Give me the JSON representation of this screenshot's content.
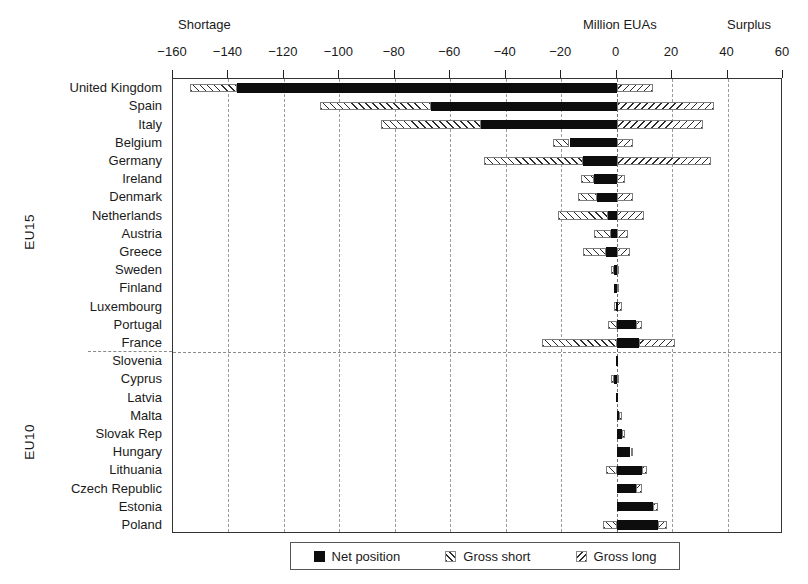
{
  "annotations": {
    "shortage": "Shortage",
    "unit": "Million EUAs",
    "surplus": "Surplus"
  },
  "groups": [
    {
      "id": "eu15",
      "label": "EU15"
    },
    {
      "id": "eu10",
      "label": "EU10"
    }
  ],
  "legend": {
    "items": [
      {
        "key": "net",
        "label": "Net position",
        "icon": "solid-square-swatch"
      },
      {
        "key": "short",
        "label": "Gross short",
        "icon": "backslash-hatch-swatch"
      },
      {
        "key": "long",
        "label": "Gross long",
        "icon": "forwardslash-hatch-swatch"
      }
    ]
  },
  "colors": {
    "net": "#0d0d0d",
    "hatch": "#2b2b2b",
    "grid": "#9a9a9a",
    "frame": "#333333",
    "background": "#ffffff"
  },
  "chart_data": {
    "type": "bar",
    "orientation": "horizontal",
    "title": "",
    "subtitle": "",
    "xlabel": "Million EUAs",
    "ylabel": "",
    "xlim": [
      -160,
      60
    ],
    "xticks": [
      -160,
      -140,
      -120,
      -100,
      -80,
      -60,
      -40,
      -20,
      0,
      20,
      40,
      60
    ],
    "xticklabels": [
      "−160",
      "−140",
      "−120",
      "−100",
      "−80",
      "−60",
      "−40",
      "−20",
      "0",
      "20",
      "40",
      "60"
    ],
    "grid": "vertical-dashed",
    "legend_position": "bottom-center",
    "annotations": [
      "Shortage",
      "Million EUAs",
      "Surplus"
    ],
    "group_divider_after": "France",
    "categories": [
      "United Kingdom",
      "Spain",
      "Italy",
      "Belgium",
      "Germany",
      "Ireland",
      "Denmark",
      "Netherlands",
      "Austria",
      "Greece",
      "Sweden",
      "Finland",
      "Luxembourg",
      "Portugal",
      "France",
      "Slovenia",
      "Cyprus",
      "Latvia",
      "Malta",
      "Slovak Rep",
      "Hungary",
      "Lithuania",
      "Czech Republic",
      "Estonia",
      "Poland"
    ],
    "category_groups": [
      "EU15",
      "EU15",
      "EU15",
      "EU15",
      "EU15",
      "EU15",
      "EU15",
      "EU15",
      "EU15",
      "EU15",
      "EU15",
      "EU15",
      "EU15",
      "EU15",
      "EU15",
      "EU10",
      "EU10",
      "EU10",
      "EU10",
      "EU10",
      "EU10",
      "EU10",
      "EU10",
      "EU10",
      "EU10"
    ],
    "series": [
      {
        "name": "Net position",
        "key": "net",
        "values": [
          -137,
          -67,
          -49,
          -17,
          -12,
          -8,
          -7,
          -3,
          -2,
          -4,
          -1,
          -1,
          0,
          7,
          8,
          0,
          -1,
          0,
          1,
          2,
          5,
          9,
          7,
          13,
          15
        ]
      },
      {
        "name": "Gross short",
        "key": "short",
        "values": [
          -154,
          -107,
          -85,
          -23,
          -48,
          -13,
          -14,
          -21,
          -8,
          -12,
          -2,
          -1,
          -1,
          -3,
          -27,
          0,
          -2,
          0,
          0,
          0,
          0,
          -4,
          0,
          0,
          -5
        ]
      },
      {
        "name": "Gross long",
        "key": "long",
        "values": [
          13,
          35,
          31,
          6,
          34,
          3,
          6,
          10,
          4,
          5,
          1,
          1,
          2,
          9,
          21,
          0,
          1,
          0,
          2,
          3,
          6,
          11,
          9,
          15,
          18
        ]
      }
    ]
  }
}
